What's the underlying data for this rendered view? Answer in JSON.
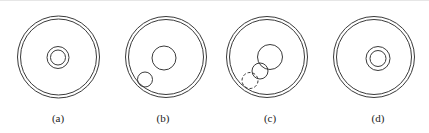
{
  "figure": {
    "stroke_color": "#3a3a3a",
    "label_color": "#222222",
    "panels": [
      {
        "label": "(a)",
        "label_pos": [
          58,
          118
        ],
        "outer_rings": {
          "cx": 58.5,
          "cy": 57,
          "r_outer": 41,
          "r_inner": 38
        },
        "circles": [
          {
            "cx": 58,
            "cy": 57.5,
            "r": 11,
            "style": "solid"
          },
          {
            "cx": 58,
            "cy": 57.5,
            "r": 7.5,
            "style": "solid"
          }
        ]
      },
      {
        "label": "(b)",
        "label_pos": [
          163,
          118
        ],
        "outer_rings": {
          "cx": 166,
          "cy": 57,
          "r_outer": 40.5,
          "r_inner": 37.5
        },
        "circles": [
          {
            "cx": 164,
            "cy": 58,
            "r": 12,
            "style": "solid"
          },
          {
            "cx": 145,
            "cy": 79.5,
            "r": 7.5,
            "style": "solid"
          }
        ]
      },
      {
        "label": "(c)",
        "label_pos": [
          270,
          118
        ],
        "outer_rings": {
          "cx": 267,
          "cy": 57,
          "r_outer": 40.5,
          "r_inner": 37.5
        },
        "circles": [
          {
            "cx": 270,
            "cy": 57,
            "r": 12.5,
            "style": "solid"
          },
          {
            "cx": 260,
            "cy": 71,
            "r": 8,
            "style": "solid"
          },
          {
            "cx": 250,
            "cy": 80.5,
            "r": 8,
            "style": "dashed"
          }
        ]
      },
      {
        "label": "(d)",
        "label_pos": [
          378,
          118
        ],
        "outer_rings": {
          "cx": 374,
          "cy": 57,
          "r_outer": 40.5,
          "r_inner": 37.5
        },
        "circles": [
          {
            "cx": 378,
            "cy": 58.5,
            "r": 12,
            "style": "solid"
          },
          {
            "cx": 378,
            "cy": 58.5,
            "r": 8,
            "style": "solid"
          }
        ]
      }
    ]
  }
}
